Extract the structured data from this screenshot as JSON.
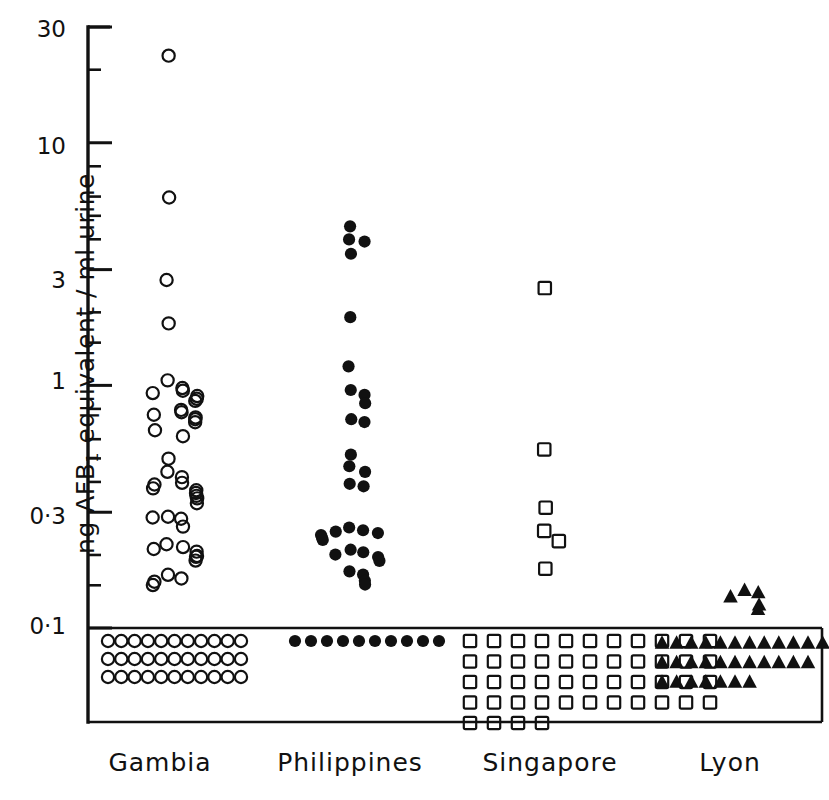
{
  "chart_data": {
    "type": "scatter",
    "title": "",
    "subtitle": "",
    "xlabel": "",
    "ylabel": "ng AFB1 equivalent / ml urine",
    "ylabel_parts": {
      "prefix": "ng AFB",
      "sub": "1",
      "suffix": " equivalent / ml urine"
    },
    "yscale": "log",
    "ylim": [
      0.1,
      30
    ],
    "grid": false,
    "legend": false,
    "detection_limit": 0.1,
    "detection_limit_label": "0·1",
    "below_limit_note": "values below detection limit plotted inside boxed region under the 0·1 line",
    "ytick_labels": [
      "30",
      "10",
      "3",
      "1",
      "0·3",
      "0·1"
    ],
    "ytick_values": [
      30,
      10,
      3,
      1,
      0.3,
      0.1
    ],
    "yminor_values": [
      20,
      8,
      6,
      5,
      4,
      2,
      1.5,
      0.8,
      0.6,
      0.5,
      0.4,
      0.2,
      0.15
    ],
    "categories": [
      "Gambia",
      "Philippines",
      "Singapore",
      "Lyon"
    ],
    "series": [
      {
        "name": "Gambia",
        "marker": "open-circle",
        "color": "#111111",
        "detected_values": [
          23.0,
          6.0,
          2.7,
          1.8,
          1.05,
          0.98,
          0.95,
          0.92,
          0.9,
          0.88,
          0.86,
          0.8,
          0.78,
          0.76,
          0.74,
          0.72,
          0.7,
          0.66,
          0.62,
          0.5,
          0.44,
          0.42,
          0.4,
          0.39,
          0.38,
          0.37,
          0.36,
          0.35,
          0.34,
          0.33,
          0.29,
          0.28,
          0.285,
          0.26,
          0.22,
          0.215,
          0.21,
          0.205,
          0.2,
          0.195,
          0.19,
          0.165,
          0.16,
          0.155,
          0.15
        ],
        "n_detected": 45,
        "below_limit_count": 33,
        "below_limit_rows": [
          11,
          11,
          11
        ]
      },
      {
        "name": "Philippines",
        "marker": "filled-circle",
        "color": "#111111",
        "detected_values": [
          4.5,
          4.0,
          3.9,
          3.5,
          1.9,
          1.2,
          0.95,
          0.92,
          0.85,
          0.72,
          0.7,
          0.52,
          0.46,
          0.44,
          0.39,
          0.38,
          0.26,
          0.255,
          0.25,
          0.245,
          0.24,
          0.235,
          0.23,
          0.21,
          0.205,
          0.2,
          0.195,
          0.19,
          0.17,
          0.165,
          0.155,
          0.15
        ],
        "n_detected": 32,
        "below_limit_count": 10,
        "below_limit_rows": [
          10
        ]
      },
      {
        "name": "Singapore",
        "marker": "open-square",
        "color": "#111111",
        "detected_values": [
          2.5,
          0.55,
          0.31,
          0.25,
          0.23,
          0.175
        ],
        "n_detected": 6,
        "below_limit_count": 48,
        "below_limit_rows": [
          11,
          11,
          11,
          11,
          4
        ]
      },
      {
        "name": "Lyon",
        "marker": "filled-triangle",
        "color": "#111111",
        "detected_values": [
          0.145,
          0.14,
          0.135,
          0.125,
          0.12
        ],
        "n_detected": 5,
        "below_limit_count": 30,
        "below_limit_rows": [
          12,
          11,
          7
        ]
      }
    ]
  },
  "axis": {
    "ytick_labels": [
      "30",
      "10",
      "3",
      "1",
      "0·3",
      "0·1"
    ],
    "ylabel_prefix": "ng AFB",
    "ylabel_sub": "1",
    "ylabel_suffix": " equivalent / ml urine"
  },
  "xaxis": {
    "labels": [
      "Gambia",
      "Philippines",
      "Singapore",
      "Lyon"
    ]
  }
}
